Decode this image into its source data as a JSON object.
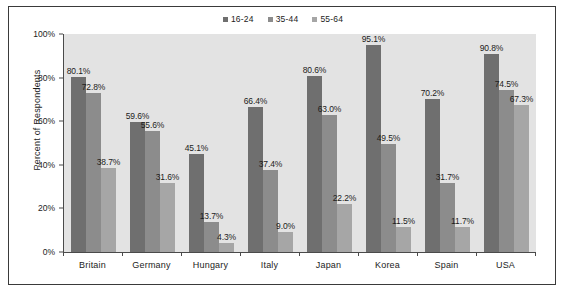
{
  "chart_data": {
    "type": "bar",
    "title": "",
    "subtitle": "",
    "xlabel": "",
    "ylabel": "Percent of Respondents",
    "ylim": [
      0,
      100
    ],
    "yticks": [
      "0%",
      "20%",
      "40%",
      "60%",
      "80%",
      "100%"
    ],
    "ytick_values": [
      0,
      20,
      40,
      60,
      80,
      100
    ],
    "grid": false,
    "legend_position": "top-center",
    "categories": [
      "Britain",
      "Germany",
      "Hungary",
      "Italy",
      "Japan",
      "Korea",
      "Spain",
      "USA"
    ],
    "series": [
      {
        "name": "16-24",
        "color": "#6f6f6f",
        "values": [
          80.1,
          59.6,
          45.1,
          66.4,
          80.6,
          95.1,
          70.2,
          90.8
        ],
        "labels": [
          "80.1%",
          "59.6%",
          "45.1%",
          "66.4%",
          "80.6%",
          "95.1%",
          "70.2%",
          "90.8%"
        ]
      },
      {
        "name": "35-44",
        "color": "#8c8c8c",
        "values": [
          72.8,
          55.6,
          13.7,
          37.4,
          63.0,
          49.5,
          31.7,
          74.5
        ],
        "labels": [
          "72.8%",
          "55.6%",
          "13.7%",
          "37.4%",
          "63.0%",
          "49.5%",
          "31.7%",
          "74.5%"
        ]
      },
      {
        "name": "55-64",
        "color": "#a6a6a6",
        "values": [
          38.7,
          31.6,
          4.3,
          9.0,
          22.2,
          11.5,
          11.7,
          67.3
        ],
        "labels": [
          "38.7%",
          "31.6%",
          "4.3%",
          "9.0%",
          "22.2%",
          "11.5%",
          "11.7%",
          "67.3%"
        ]
      }
    ],
    "plot_background": "#e3e3e3",
    "frame_color": "#3a3a3a",
    "axis_color": "#4a4a4a",
    "text_color": "#1c1c1c"
  }
}
